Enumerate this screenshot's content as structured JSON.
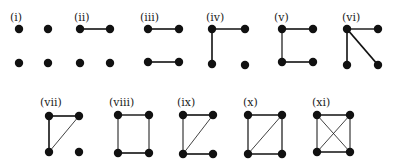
{
  "styles": {
    "node_color": "#111111",
    "edge_color": "#111111",
    "node_radius": 4.2
  },
  "graphs": [
    {
      "label": "(i)",
      "label_pos": [
        10,
        12
      ],
      "nodes": [
        [
          19,
          29
        ],
        [
          48,
          29
        ],
        [
          19,
          63
        ],
        [
          48,
          63
        ]
      ],
      "edges": []
    },
    {
      "label": "(ii)",
      "label_pos": [
        74,
        12
      ],
      "nodes": [
        [
          80,
          29
        ],
        [
          110,
          29
        ],
        [
          80,
          63
        ],
        [
          110,
          63
        ]
      ],
      "edges": [
        [
          0,
          1,
          1.6
        ]
      ]
    },
    {
      "label": "(iii)",
      "label_pos": [
        140,
        12
      ],
      "nodes": [
        [
          148,
          29
        ],
        [
          179,
          29
        ],
        [
          148,
          62
        ],
        [
          179,
          62
        ]
      ],
      "edges": [
        [
          0,
          1,
          1.6
        ],
        [
          2,
          3,
          1.6
        ]
      ]
    },
    {
      "label": "(iv)",
      "label_pos": [
        206,
        12
      ],
      "nodes": [
        [
          212,
          29
        ],
        [
          245,
          29
        ],
        [
          212,
          64
        ],
        [
          245,
          65
        ]
      ],
      "edges": [
        [
          0,
          1,
          1.6
        ],
        [
          0,
          2,
          1.6
        ]
      ]
    },
    {
      "label": "(v)",
      "label_pos": [
        274,
        12
      ],
      "nodes": [
        [
          282,
          29
        ],
        [
          313,
          29
        ],
        [
          282,
          62
        ],
        [
          313,
          62
        ]
      ],
      "edges": [
        [
          0,
          1,
          1.6
        ],
        [
          0,
          2,
          1.2
        ],
        [
          2,
          3,
          1.6
        ]
      ]
    },
    {
      "label": "(vi)",
      "label_pos": [
        342,
        12
      ],
      "nodes": [
        [
          347,
          29
        ],
        [
          378,
          29
        ],
        [
          347,
          65
        ],
        [
          378,
          65
        ]
      ],
      "edges": [
        [
          0,
          1,
          1.4
        ],
        [
          0,
          2,
          1.6
        ],
        [
          0,
          3,
          1.8
        ]
      ]
    },
    {
      "label": "(vii)",
      "label_pos": [
        40,
        97
      ],
      "nodes": [
        [
          49,
          116
        ],
        [
          79,
          116
        ],
        [
          49,
          152
        ],
        [
          79,
          152
        ]
      ],
      "edges": [
        [
          0,
          1,
          1.6
        ],
        [
          0,
          2,
          1.6
        ],
        [
          1,
          2,
          0.8
        ]
      ]
    },
    {
      "label": "(viii)",
      "label_pos": [
        109,
        97
      ],
      "nodes": [
        [
          118,
          115
        ],
        [
          149,
          115
        ],
        [
          118,
          153
        ],
        [
          149,
          153
        ]
      ],
      "edges": [
        [
          0,
          1,
          1.4
        ],
        [
          0,
          2,
          1.0
        ],
        [
          1,
          3,
          1.0
        ],
        [
          2,
          3,
          1.6
        ]
      ]
    },
    {
      "label": "(ix)",
      "label_pos": [
        177,
        97
      ],
      "nodes": [
        [
          183,
          115
        ],
        [
          213,
          115
        ],
        [
          183,
          154
        ],
        [
          213,
          154
        ]
      ],
      "edges": [
        [
          0,
          1,
          1.6
        ],
        [
          0,
          2,
          1.0
        ],
        [
          1,
          2,
          0.8
        ],
        [
          2,
          3,
          1.6
        ]
      ]
    },
    {
      "label": "(x)",
      "label_pos": [
        243,
        97
      ],
      "nodes": [
        [
          248,
          115
        ],
        [
          282,
          115
        ],
        [
          248,
          154
        ],
        [
          282,
          154
        ]
      ],
      "edges": [
        [
          0,
          1,
          1.6
        ],
        [
          0,
          2,
          1.2
        ],
        [
          1,
          3,
          1.2
        ],
        [
          2,
          3,
          1.6
        ],
        [
          1,
          2,
          0.8
        ]
      ]
    },
    {
      "label": "(xi)",
      "label_pos": [
        312,
        97
      ],
      "nodes": [
        [
          317,
          115
        ],
        [
          350,
          115
        ],
        [
          317,
          152
        ],
        [
          350,
          152
        ]
      ],
      "edges": [
        [
          0,
          1,
          1.4
        ],
        [
          0,
          2,
          1.0
        ],
        [
          1,
          3,
          1.0
        ],
        [
          2,
          3,
          1.6
        ],
        [
          0,
          3,
          0.8
        ],
        [
          1,
          2,
          0.8
        ]
      ]
    }
  ]
}
